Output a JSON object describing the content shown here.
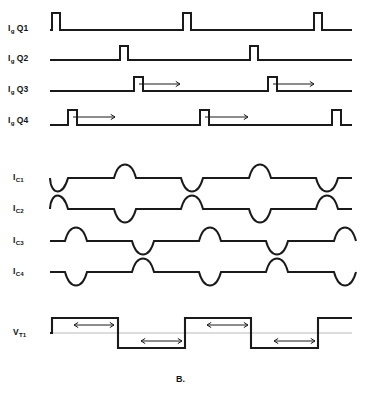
{
  "figure": {
    "part_label": "B.",
    "background": "#ffffff",
    "trace_color": "#1a1a1a",
    "baseline_color": "#b9b9b9"
  },
  "labels": {
    "gate": [
      {
        "symbol": "I",
        "sub": "g",
        "device": "Q1",
        "text": "I",
        "full": "Ig Q1"
      },
      {
        "symbol": "I",
        "sub": "g",
        "device": "Q2",
        "text": "I",
        "full": "Ig Q2"
      },
      {
        "symbol": "I",
        "sub": "g",
        "device": "Q3",
        "text": "I",
        "full": "Ig Q3"
      },
      {
        "symbol": "I",
        "sub": "g",
        "device": "Q4",
        "text": "I",
        "full": "Ig Q4"
      }
    ],
    "capacitor": [
      {
        "symbol": "I",
        "sub": "C1",
        "full": "IC1"
      },
      {
        "symbol": "I",
        "sub": "C2",
        "full": "IC2"
      },
      {
        "symbol": "I",
        "sub": "C3",
        "full": "IC3"
      },
      {
        "symbol": "I",
        "sub": "C4",
        "full": "IC4"
      }
    ],
    "voltage": {
      "symbol": "V",
      "sub": "T1",
      "full": "VT1"
    }
  },
  "chart_data": {
    "type": "line",
    "title": "B.",
    "xlabel": "",
    "ylabel": "",
    "grid": false,
    "legend": false,
    "x_range": [
      0,
      366
    ],
    "traces": [
      {
        "name": "Ig Q1",
        "kind": "gate-pulse-train",
        "baseline_y": 30,
        "pulse_height": 17,
        "pulse_width": 8,
        "pulse_starts": [
          52,
          183,
          314
        ],
        "arrows": []
      },
      {
        "name": "Ig Q2",
        "kind": "gate-pulse-train",
        "baseline_y": 60,
        "pulse_height": 14,
        "pulse_width": 8,
        "pulse_starts": [
          120,
          250
        ],
        "arrows": []
      },
      {
        "name": "Ig Q3",
        "kind": "gate-pulse-train",
        "baseline_y": 91,
        "pulse_height": 14,
        "pulse_width": 9,
        "pulse_starts": [
          134,
          268
        ],
        "arrows": [
          {
            "from_x": 139,
            "to_x": 180,
            "y": 84,
            "direction": "right"
          },
          {
            "from_x": 273,
            "to_x": 314,
            "y": 84,
            "direction": "right"
          }
        ]
      },
      {
        "name": "Ig Q4",
        "kind": "gate-pulse-train",
        "baseline_y": 125,
        "pulse_height": 15,
        "pulse_width": 9,
        "pulse_starts": [
          68,
          200,
          332
        ],
        "arrows": [
          {
            "from_x": 73,
            "to_x": 115,
            "y": 117,
            "direction": "right"
          },
          {
            "from_x": 205,
            "to_x": 248,
            "y": 117,
            "direction": "right"
          }
        ]
      },
      {
        "name": "IC1",
        "kind": "half-sine-train",
        "baseline_y": 178,
        "amplitude": 13,
        "lobe_width": 22,
        "lobes": [
          {
            "center_x": 57,
            "polarity": "down"
          },
          {
            "center_x": 125,
            "polarity": "up"
          },
          {
            "center_x": 192,
            "polarity": "down"
          },
          {
            "center_x": 260,
            "polarity": "up"
          },
          {
            "center_x": 327,
            "polarity": "down"
          }
        ]
      },
      {
        "name": "IC2",
        "kind": "half-sine-train",
        "baseline_y": 209,
        "amplitude": 13,
        "lobe_width": 22,
        "lobes": [
          {
            "center_x": 57,
            "polarity": "up"
          },
          {
            "center_x": 125,
            "polarity": "down"
          },
          {
            "center_x": 192,
            "polarity": "up"
          },
          {
            "center_x": 260,
            "polarity": "down"
          },
          {
            "center_x": 327,
            "polarity": "up"
          }
        ]
      },
      {
        "name": "IC3",
        "kind": "half-sine-train",
        "baseline_y": 241,
        "amplitude": 13,
        "lobe_width": 22,
        "lobes": [
          {
            "center_x": 76,
            "polarity": "up"
          },
          {
            "center_x": 143,
            "polarity": "down"
          },
          {
            "center_x": 210,
            "polarity": "up"
          },
          {
            "center_x": 277,
            "polarity": "down"
          },
          {
            "center_x": 345,
            "polarity": "up"
          }
        ]
      },
      {
        "name": "IC4",
        "kind": "half-sine-train",
        "baseline_y": 272,
        "amplitude": 13,
        "lobe_width": 22,
        "lobes": [
          {
            "center_x": 76,
            "polarity": "down"
          },
          {
            "center_x": 143,
            "polarity": "up"
          },
          {
            "center_x": 210,
            "polarity": "down"
          },
          {
            "center_x": 277,
            "polarity": "up"
          },
          {
            "center_x": 345,
            "polarity": "down"
          }
        ]
      },
      {
        "name": "VT1",
        "kind": "bipolar-square",
        "baseline_y": 333,
        "amplitude": 15,
        "edges_x": [
          52,
          70,
          118,
          137,
          185,
          203,
          251,
          270,
          318,
          336
        ],
        "levels": [
          0,
          1,
          1,
          -1,
          -1,
          1,
          1,
          -1,
          -1,
          1
        ],
        "arrows": [
          {
            "from_x": 74,
            "to_x": 114,
            "y": 325,
            "direction": "both"
          },
          {
            "from_x": 141,
            "to_x": 182,
            "y": 341,
            "direction": "both"
          },
          {
            "from_x": 207,
            "to_x": 248,
            "y": 325,
            "direction": "both"
          },
          {
            "from_x": 274,
            "to_x": 315,
            "y": 341,
            "direction": "both"
          }
        ]
      }
    ]
  }
}
